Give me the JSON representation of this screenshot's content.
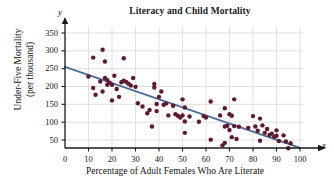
{
  "chart_data": {
    "type": "scatter",
    "title": "Literacy and Child Mortality",
    "xlabel": "Percentage of Adult Females Who Are Literate",
    "ylabel_line1": "Under-Five Mortality",
    "ylabel_line2": "(per thousand)",
    "x_axis_letter": "x",
    "y_axis_letter": "y",
    "xlim": [
      0,
      103
    ],
    "ylim": [
      0,
      375
    ],
    "xticks": [
      0,
      10,
      20,
      30,
      40,
      50,
      60,
      70,
      80,
      90,
      100
    ],
    "yticks": [
      50,
      100,
      150,
      200,
      250,
      300,
      350
    ],
    "grid": true,
    "grid_color": "#d9d9d9",
    "point_color": "#5e1a30",
    "line_color": "#4e6d99",
    "axis_color": "#1a1a1a",
    "trendline": {
      "name": "least-squares regression line",
      "x": [
        0,
        100
      ],
      "y": [
        255,
        28
      ]
    },
    "series": [
      {
        "name": "Countries",
        "points": [
          [
            10,
            228
          ],
          [
            12,
            281
          ],
          [
            12,
            196
          ],
          [
            13,
            177
          ],
          [
            15,
            214
          ],
          [
            16,
            303
          ],
          [
            16,
            186
          ],
          [
            17,
            270
          ],
          [
            17,
            224
          ],
          [
            18,
            218
          ],
          [
            18,
            205
          ],
          [
            19,
            211
          ],
          [
            20,
            205
          ],
          [
            20,
            161
          ],
          [
            21,
            230
          ],
          [
            22,
            193
          ],
          [
            23,
            171
          ],
          [
            24,
            212
          ],
          [
            25,
            279
          ],
          [
            25,
            216
          ],
          [
            26,
            213
          ],
          [
            27,
            208
          ],
          [
            28,
            203
          ],
          [
            29,
            224
          ],
          [
            30,
            199
          ],
          [
            31,
            153
          ],
          [
            33,
            144
          ],
          [
            35,
            125
          ],
          [
            36,
            134
          ],
          [
            37,
            88
          ],
          [
            38,
            207
          ],
          [
            38,
            197
          ],
          [
            39,
            151
          ],
          [
            39,
            131
          ],
          [
            40,
            171
          ],
          [
            41,
            186
          ],
          [
            42,
            149
          ],
          [
            43,
            152
          ],
          [
            44,
            119
          ],
          [
            46,
            146
          ],
          [
            47,
            122
          ],
          [
            48,
            118
          ],
          [
            49,
            113
          ],
          [
            50,
            164
          ],
          [
            50,
            119
          ],
          [
            51,
            141
          ],
          [
            51,
            102
          ],
          [
            51,
            70
          ],
          [
            53,
            116
          ],
          [
            57,
            101
          ],
          [
            59,
            117
          ],
          [
            60,
            113
          ],
          [
            62,
            158
          ],
          [
            62,
            51
          ],
          [
            66,
            119
          ],
          [
            67,
            35
          ],
          [
            68,
            139
          ],
          [
            68,
            88
          ],
          [
            68,
            42
          ],
          [
            69,
            90
          ],
          [
            70,
            122
          ],
          [
            70,
            78
          ],
          [
            71,
            118
          ],
          [
            71,
            58
          ],
          [
            72,
            164
          ],
          [
            72,
            89
          ],
          [
            73,
            53
          ],
          [
            74,
            87
          ],
          [
            78,
            84
          ],
          [
            80,
            117
          ],
          [
            81,
            88
          ],
          [
            82,
            76
          ],
          [
            83,
            110
          ],
          [
            83,
            48
          ],
          [
            84,
            91
          ],
          [
            85,
            70
          ],
          [
            86,
            81
          ],
          [
            87,
            64
          ],
          [
            88,
            68
          ],
          [
            89,
            59
          ],
          [
            90,
            77
          ],
          [
            90,
            62
          ],
          [
            91,
            47
          ],
          [
            93,
            63
          ],
          [
            94,
            46
          ],
          [
            95,
            27
          ],
          [
            96,
            41
          ]
        ]
      }
    ]
  }
}
